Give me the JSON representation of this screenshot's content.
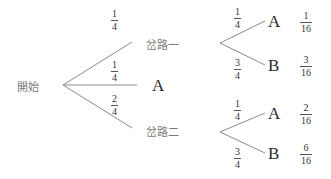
{
  "diagram": {
    "type": "probability-tree",
    "root": {
      "label": "開始"
    },
    "level1": [
      {
        "id": "fork1",
        "label": "岔路一",
        "prob": {
          "num": "1",
          "den": "4"
        }
      },
      {
        "id": "a",
        "label": "A",
        "prob": {
          "num": "1",
          "den": "4"
        }
      },
      {
        "id": "fork2",
        "label": "岔路二",
        "prob": {
          "num": "2",
          "den": "4"
        }
      }
    ],
    "fork1_children": [
      {
        "label": "A",
        "prob": {
          "num": "1",
          "den": "4"
        },
        "result": {
          "num": "1",
          "den": "16"
        }
      },
      {
        "label": "B",
        "prob": {
          "num": "3",
          "den": "4"
        },
        "result": {
          "num": "3",
          "den": "16"
        }
      }
    ],
    "fork2_children": [
      {
        "label": "A",
        "prob": {
          "num": "1",
          "den": "4"
        },
        "result": {
          "num": "2",
          "den": "16"
        }
      },
      {
        "label": "B",
        "prob": {
          "num": "3",
          "den": "4"
        },
        "result": {
          "num": "6",
          "den": "16"
        }
      }
    ],
    "colors": {
      "line": "#8a8a8a",
      "text": "#333333",
      "cjk_text": "#7a7a7a"
    }
  }
}
